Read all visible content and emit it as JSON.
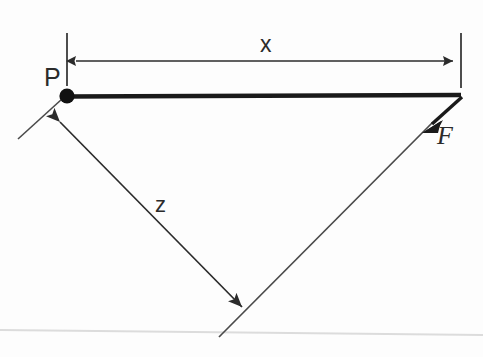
{
  "figure": {
    "background_color": "#fdfdfd",
    "stroke_color": "#2b2b2b",
    "thin_stroke_color": "#4a4a4a",
    "faint_line_color": "#dcdcdc",
    "labels": {
      "point_p": "P",
      "dimension_x": "x",
      "dimension_z": "z",
      "force_f": "F"
    }
  },
  "geometry": {
    "canvas": {
      "width": 483,
      "height": 357
    },
    "pivot_point": {
      "name": "P",
      "x": 67,
      "y": 96,
      "radius": 7.5
    },
    "beam": {
      "name": "rigid-beam",
      "x1": 67,
      "y1": 96,
      "x2": 461,
      "y2": 95,
      "stroke_width": 4.5
    },
    "dimension_x": {
      "name": "x-dimension",
      "line": {
        "x1": 74,
        "y1": 61,
        "x2": 455,
        "y2": 61
      },
      "extension_left": {
        "x1": 67,
        "y1": 33,
        "x2": 67,
        "y2": 86
      },
      "extension_right": {
        "x1": 461,
        "y1": 33,
        "x2": 461,
        "y2": 88
      },
      "label_pos": {
        "x": 267,
        "y": 50
      },
      "arrows": "both"
    },
    "force_vector": {
      "name": "force-F",
      "tip": {
        "x": 424,
        "y": 131
      },
      "tail": {
        "x": 462,
        "y": 97
      },
      "line_extension": {
        "x1": 434,
        "y1": 122,
        "x2": 219,
        "y2": 337
      },
      "label_pos": {
        "x": 441,
        "y": 140
      }
    },
    "z_vector": {
      "name": "z-dimension",
      "tip_upper": {
        "x": 54,
        "y": 116
      },
      "tip_lower": {
        "x": 248,
        "y": 313
      },
      "line": {
        "x1": 58,
        "y1": 120,
        "x2": 244,
        "y2": 309
      },
      "label_pos": {
        "x": 162,
        "y": 210
      }
    },
    "perpendicular_mark": {
      "name": "perpendicular-guide",
      "x1": 18,
      "y1": 139,
      "x2": 62,
      "y2": 99
    },
    "baseline": {
      "name": "ground-baseline",
      "x1": 0,
      "y1": 330,
      "x2": 483,
      "y2": 335
    }
  }
}
